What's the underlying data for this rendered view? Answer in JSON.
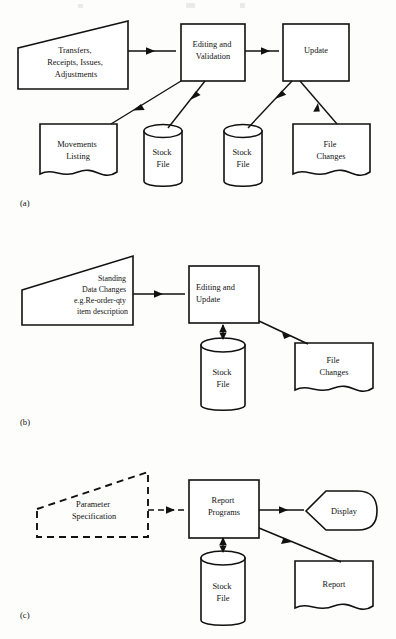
{
  "document": {
    "type": "flowchart-set",
    "title": "Stock control system flowcharts",
    "background_color": "#fdfdfb",
    "ink_color": "#111111"
  },
  "figures": [
    {
      "id": "a",
      "label": "(a)",
      "nodes": {
        "input": {
          "shape": "manual-input-trapezoid",
          "lines": [
            "Transfers,",
            "Receipts, Issues,",
            "Adjustments"
          ]
        },
        "process1": {
          "shape": "process-box",
          "lines": [
            "Editing and",
            "Validation"
          ]
        },
        "process2": {
          "shape": "process-box",
          "lines": [
            "Update"
          ]
        },
        "output1": {
          "shape": "document",
          "lines": [
            "Movements",
            "Listing"
          ]
        },
        "store1": {
          "shape": "cylinder",
          "lines": [
            "Stock",
            "File"
          ]
        },
        "store2": {
          "shape": "cylinder",
          "lines": [
            "Stock",
            "File"
          ]
        },
        "output2": {
          "shape": "document",
          "lines": [
            "File",
            "Changes"
          ]
        }
      },
      "connectors": [
        {
          "from": "input",
          "to": "process1",
          "style": "solid",
          "arrow": "end"
        },
        {
          "from": "process1",
          "to": "process2",
          "style": "solid",
          "arrow": "end"
        },
        {
          "from": "process1",
          "to": "output1",
          "style": "solid",
          "arrow": "end"
        },
        {
          "from": "store1",
          "to": "process1",
          "style": "solid",
          "arrow": "end"
        },
        {
          "from": "store2",
          "to": "process2",
          "style": "solid",
          "arrow": "end"
        },
        {
          "from": "process2",
          "to": "output2",
          "style": "solid",
          "arrow": "end"
        }
      ]
    },
    {
      "id": "b",
      "label": "(b)",
      "nodes": {
        "input": {
          "shape": "manual-input-trapezoid",
          "lines": [
            "Standing",
            "Data Changes",
            "e.g.Re-order-qty",
            "item description"
          ]
        },
        "process1": {
          "shape": "process-box",
          "lines": [
            "Editing and",
            "Update"
          ]
        },
        "store1": {
          "shape": "cylinder",
          "lines": [
            "Stock",
            "File"
          ]
        },
        "output1": {
          "shape": "document",
          "lines": [
            "File",
            "Changes"
          ]
        }
      },
      "connectors": [
        {
          "from": "input",
          "to": "process1",
          "style": "solid",
          "arrow": "end"
        },
        {
          "from": "process1",
          "to": "store1",
          "style": "solid",
          "arrow": "both"
        },
        {
          "from": "process1",
          "to": "output1",
          "style": "solid",
          "arrow": "end"
        }
      ]
    },
    {
      "id": "c",
      "label": "(c)",
      "nodes": {
        "input": {
          "shape": "manual-input-trapezoid-dashed",
          "lines": [
            "Parameter",
            "Specification"
          ]
        },
        "process1": {
          "shape": "process-box",
          "lines": [
            "Report",
            "Programs"
          ]
        },
        "store1": {
          "shape": "cylinder",
          "lines": [
            "Stock",
            "File"
          ]
        },
        "output1": {
          "shape": "display",
          "lines": [
            "Display"
          ]
        },
        "output2": {
          "shape": "document",
          "lines": [
            "Report"
          ]
        }
      },
      "connectors": [
        {
          "from": "input",
          "to": "process1",
          "style": "dashed",
          "arrow": "end"
        },
        {
          "from": "process1",
          "to": "output1",
          "style": "solid",
          "arrow": "end"
        },
        {
          "from": "process1",
          "to": "store1",
          "style": "solid",
          "arrow": "both"
        },
        {
          "from": "process1",
          "to": "output2",
          "style": "solid",
          "arrow": "end"
        }
      ]
    }
  ]
}
